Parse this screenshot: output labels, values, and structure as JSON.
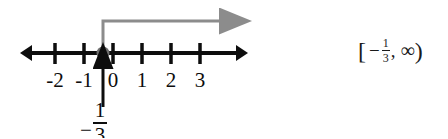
{
  "figure": {
    "name": "number-line-inequality-graph",
    "background_color": "#ffffff",
    "number_line": {
      "axis_color": "#0d0d0d",
      "y": 53,
      "left_arrow_x": 22,
      "right_arrow_x": 245,
      "tick_spacing": 29,
      "ticks": [
        {
          "label": "-2",
          "value": -2,
          "x": 55
        },
        {
          "label": "-1",
          "value": -1,
          "x": 84
        },
        {
          "label": "0",
          "value": 0,
          "x": 113
        },
        {
          "label": "1",
          "value": 1,
          "x": 142
        },
        {
          "label": "2",
          "value": 2,
          "x": 171
        },
        {
          "label": "3",
          "value": 3,
          "x": 200
        }
      ]
    },
    "point": {
      "name": "closed-endpoint-dot",
      "value": -0.3333,
      "x": 103,
      "y": 53,
      "color": "#6e6e6e",
      "style": "closed"
    },
    "ray": {
      "name": "solution-ray",
      "color": "#8c8c8c",
      "direction": "right",
      "description": "ray rising from endpoint then extending right to infinity",
      "start_x": 103,
      "top_y": 21,
      "end_x": 232
    },
    "pointer": {
      "name": "endpoint-pointer-arrow",
      "color": "#0d0d0d",
      "x": 103,
      "from_y": 107,
      "to_y": 60
    },
    "point_label": {
      "name": "endpoint-value-label",
      "minus": "−",
      "numerator": "1",
      "denominator": "3",
      "text": "-1/3"
    }
  },
  "interval": {
    "name": "interval-notation",
    "open_bracket": "[",
    "minus": "−",
    "numerator": "1",
    "denominator": "3",
    "comma": ",",
    "infinity": "∞",
    "close_paren": ")",
    "text": "[-1/3, ∞)"
  }
}
